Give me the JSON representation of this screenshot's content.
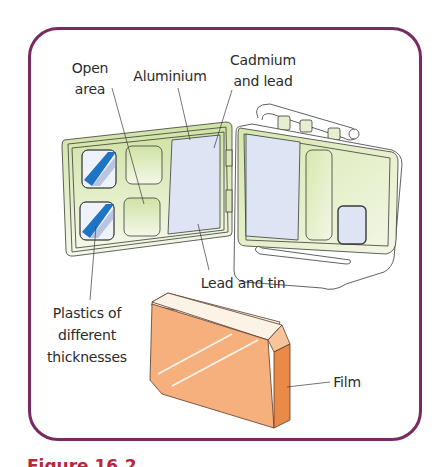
{
  "figure": {
    "frame_color": "#7a2a62",
    "caption_color": "#b8283c",
    "caption_visible_fragment": "Figure 16.2"
  },
  "labels": {
    "open_area": [
      "Open",
      "area"
    ],
    "aluminium": "Aluminium",
    "cadmium_and_lead": [
      "Cadmium",
      "and lead"
    ],
    "lead_and_tin": "Lead and tin",
    "plastics": [
      "Plastics of",
      "different",
      "thicknesses"
    ],
    "film": "Film"
  },
  "colors": {
    "badge_green": "#dbe9b8",
    "badge_green_light": "#f1f6e2",
    "filter_blue": "#dde5f4",
    "plastic_stripe": "#1f74c4",
    "film_face": "#f6b07e",
    "film_side": "#e98a48",
    "film_top": "#fbf3e6",
    "outline": "#3a3a3a"
  }
}
